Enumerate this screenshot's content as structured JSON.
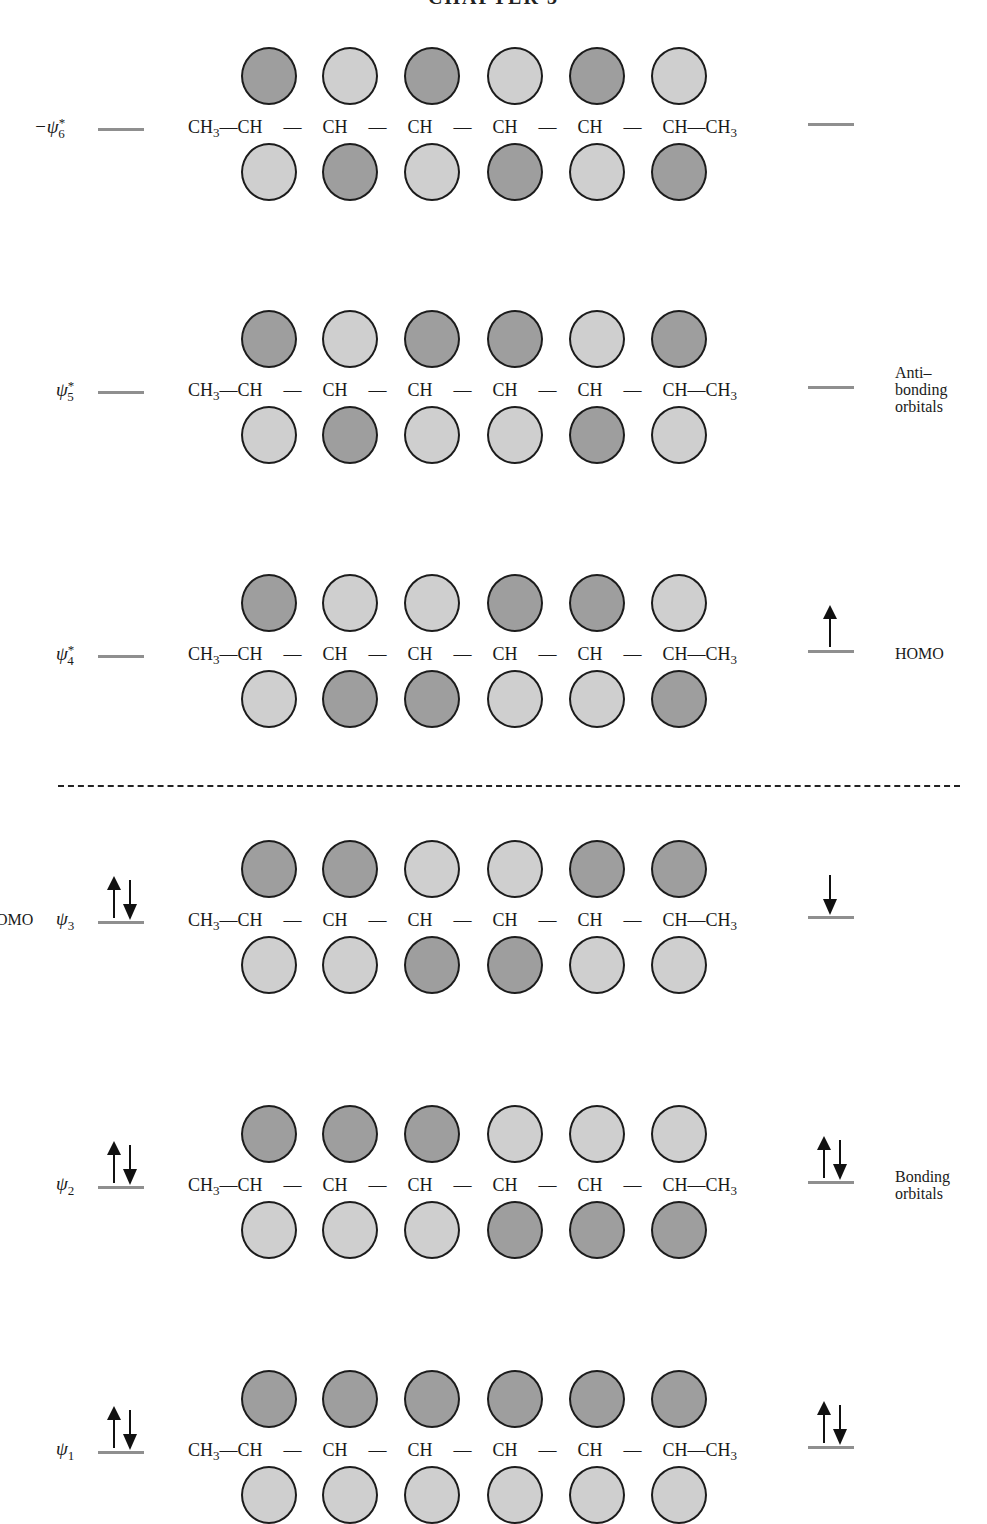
{
  "header": {
    "text": "CHAPTER 3"
  },
  "divider": {
    "style": "dashed",
    "y": 786
  },
  "colors": {
    "lobe_dark": "#9e9e9e",
    "lobe_light": "#cfcfcf",
    "level_line": "#8f8f8f",
    "outline": "#1c1c1c"
  },
  "chain": {
    "left_end": "CH",
    "left_sub": "3",
    "unit": "CH",
    "right_end": "CH",
    "right_sub": "3",
    "bond": "—"
  },
  "groups": {
    "antibonding": {
      "label": "Anti–\nbonding\norbitals"
    },
    "bonding": {
      "label": "Bonding\norbitals"
    }
  },
  "orbitals": [
    {
      "name": "ψ6*",
      "psi": "ψ",
      "sub": "6",
      "star": "*",
      "prefix": "−",
      "y": 127,
      "top": [
        "dark",
        "light",
        "dark",
        "light",
        "dark",
        "light"
      ],
      "bottom": [
        "light",
        "dark",
        "light",
        "dark",
        "light",
        "dark"
      ],
      "left_electrons": "none",
      "right_electrons": "none",
      "right_label": "",
      "left_outer_label": ""
    },
    {
      "name": "ψ5*",
      "psi": "ψ",
      "sub": "5",
      "star": "*",
      "prefix": "",
      "y": 390,
      "top": [
        "dark",
        "light",
        "dark",
        "dark",
        "light",
        "dark"
      ],
      "bottom": [
        "light",
        "dark",
        "light",
        "light",
        "dark",
        "light"
      ],
      "left_electrons": "none",
      "right_electrons": "none",
      "right_label": "Anti–\nbonding\norbitals",
      "left_outer_label": ""
    },
    {
      "name": "ψ4*",
      "psi": "ψ",
      "sub": "4",
      "star": "*",
      "prefix": "",
      "y": 654,
      "top": [
        "dark",
        "light",
        "light",
        "dark",
        "dark",
        "light"
      ],
      "bottom": [
        "light",
        "dark",
        "dark",
        "light",
        "light",
        "dark"
      ],
      "left_electrons": "none",
      "right_electrons": "up",
      "right_label": "HOMO",
      "left_outer_label": ""
    },
    {
      "name": "ψ3",
      "psi": "ψ",
      "sub": "3",
      "star": "",
      "prefix": "",
      "y": 920,
      "top": [
        "dark",
        "dark",
        "light",
        "light",
        "dark",
        "dark"
      ],
      "bottom": [
        "light",
        "light",
        "dark",
        "dark",
        "light",
        "light"
      ],
      "left_electrons": "pair",
      "right_electrons": "down",
      "right_label": "",
      "left_outer_label": "OMO"
    },
    {
      "name": "ψ2",
      "psi": "ψ",
      "sub": "2",
      "star": "",
      "prefix": "",
      "y": 1185,
      "top": [
        "dark",
        "dark",
        "dark",
        "light",
        "light",
        "light"
      ],
      "bottom": [
        "light",
        "light",
        "light",
        "dark",
        "dark",
        "dark"
      ],
      "left_electrons": "pair",
      "right_electrons": "pair",
      "right_label": "Bonding\norbitals",
      "left_outer_label": ""
    },
    {
      "name": "ψ1",
      "psi": "ψ",
      "sub": "1",
      "star": "",
      "prefix": "",
      "y": 1450,
      "top": [
        "dark",
        "dark",
        "dark",
        "dark",
        "dark",
        "dark"
      ],
      "bottom": [
        "light",
        "light",
        "light",
        "light",
        "light",
        "light"
      ],
      "left_electrons": "pair",
      "right_electrons": "pair",
      "right_label": "",
      "left_outer_label": ""
    }
  ]
}
